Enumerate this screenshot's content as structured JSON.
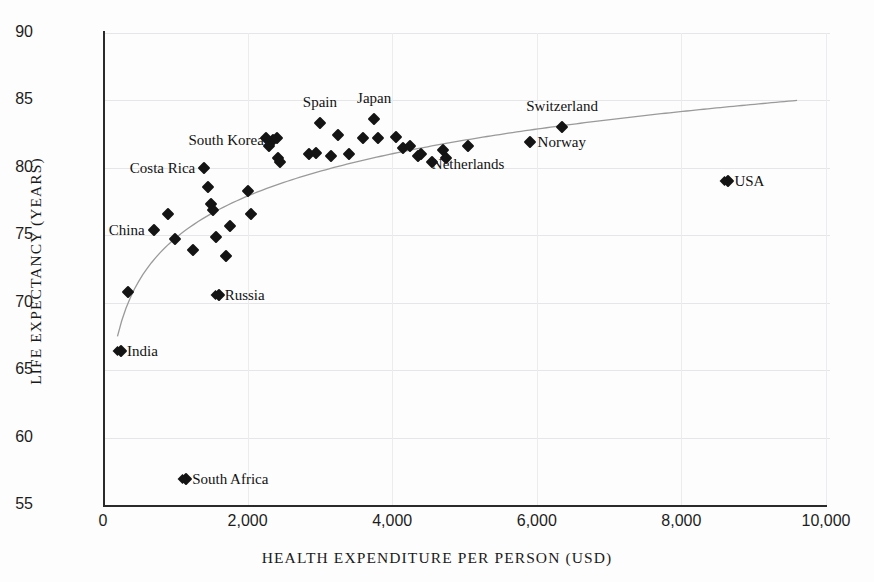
{
  "chart_data": {
    "type": "scatter",
    "title": "",
    "xlabel": "HEALTH EXPENDITURE PER PERSON (USD)",
    "ylabel": "LIFE EXPECTANCY (YEARS)",
    "xlim": [
      0,
      10000
    ],
    "ylim": [
      55,
      90
    ],
    "xticks": [
      "0",
      "2,000",
      "4,000",
      "6,000",
      "8,000",
      "10,000"
    ],
    "xtick_values": [
      0,
      2000,
      4000,
      6000,
      8000,
      10000
    ],
    "yticks": [
      "55",
      "60",
      "65",
      "70",
      "75",
      "80",
      "85",
      "90"
    ],
    "ytick_values": [
      55,
      60,
      65,
      70,
      75,
      80,
      85,
      90
    ],
    "grid": "both-light",
    "legend": "none",
    "marker": "filled-diamond",
    "marker_color": "#141414",
    "trendline": {
      "type": "logarithmic",
      "color": "#9a9a9a",
      "x_start": 200,
      "y_start": 67.5,
      "x_end": 9600,
      "y_end": 85.0
    },
    "points": [
      {
        "label": "India",
        "x": 250,
        "y": 66.4,
        "label_pos": "right",
        "lead_marker": true
      },
      {
        "label": "China",
        "x": 700,
        "y": 75.4,
        "label_pos": "left",
        "lead_marker": false
      },
      {
        "label": "South Africa",
        "x": 1150,
        "y": 56.9,
        "label_pos": "right",
        "lead_marker": true
      },
      {
        "label": "Russia",
        "x": 1600,
        "y": 70.6,
        "label_pos": "right",
        "lead_marker": true
      },
      {
        "label": "Costa Rica",
        "x": 1400,
        "y": 80.0,
        "label_pos": "left",
        "lead_marker": false
      },
      {
        "label": "South Korea",
        "x": 2350,
        "y": 82.1,
        "label_pos": "left",
        "lead_marker": false
      },
      {
        "label": "Spain",
        "x": 3000,
        "y": 83.3,
        "label_pos": "above",
        "lead_marker": false
      },
      {
        "label": "Japan",
        "x": 3750,
        "y": 83.6,
        "label_pos": "above",
        "lead_marker": false
      },
      {
        "label": "Switzerland",
        "x": 6350,
        "y": 83.0,
        "label_pos": "above",
        "lead_marker": false
      },
      {
        "label": "Norway",
        "x": 5900,
        "y": 81.9,
        "label_pos": "right",
        "lead_marker": false
      },
      {
        "label": "Netherlands",
        "x": 5050,
        "y": 81.6,
        "label_pos": "below",
        "lead_marker": false
      },
      {
        "label": "USA",
        "x": 8650,
        "y": 79.0,
        "label_pos": "right",
        "lead_marker": true
      },
      {
        "label": "",
        "x": 350,
        "y": 70.8
      },
      {
        "label": "",
        "x": 900,
        "y": 76.6
      },
      {
        "label": "",
        "x": 1000,
        "y": 74.7
      },
      {
        "label": "",
        "x": 1250,
        "y": 73.9
      },
      {
        "label": "",
        "x": 1450,
        "y": 78.6
      },
      {
        "label": "",
        "x": 1500,
        "y": 77.3
      },
      {
        "label": "",
        "x": 1520,
        "y": 76.9
      },
      {
        "label": "",
        "x": 1560,
        "y": 74.9
      },
      {
        "label": "",
        "x": 1700,
        "y": 73.5
      },
      {
        "label": "",
        "x": 1750,
        "y": 75.7
      },
      {
        "label": "",
        "x": 2000,
        "y": 78.3
      },
      {
        "label": "",
        "x": 2050,
        "y": 76.6
      },
      {
        "label": "",
        "x": 2250,
        "y": 82.2
      },
      {
        "label": "",
        "x": 2300,
        "y": 81.6
      },
      {
        "label": "",
        "x": 2400,
        "y": 82.2
      },
      {
        "label": "",
        "x": 2420,
        "y": 80.7
      },
      {
        "label": "",
        "x": 2450,
        "y": 80.4
      },
      {
        "label": "",
        "x": 2850,
        "y": 81.0
      },
      {
        "label": "",
        "x": 2950,
        "y": 81.1
      },
      {
        "label": "",
        "x": 3150,
        "y": 80.9
      },
      {
        "label": "",
        "x": 3250,
        "y": 82.4
      },
      {
        "label": "",
        "x": 3400,
        "y": 81.0
      },
      {
        "label": "",
        "x": 3600,
        "y": 82.2
      },
      {
        "label": "",
        "x": 3800,
        "y": 82.2
      },
      {
        "label": "",
        "x": 4050,
        "y": 82.3
      },
      {
        "label": "",
        "x": 4150,
        "y": 81.5
      },
      {
        "label": "",
        "x": 4250,
        "y": 81.6
      },
      {
        "label": "",
        "x": 4350,
        "y": 80.9
      },
      {
        "label": "",
        "x": 4400,
        "y": 81.0
      },
      {
        "label": "",
        "x": 4550,
        "y": 80.4
      },
      {
        "label": "",
        "x": 4700,
        "y": 81.3
      },
      {
        "label": "",
        "x": 4750,
        "y": 80.7
      }
    ]
  }
}
